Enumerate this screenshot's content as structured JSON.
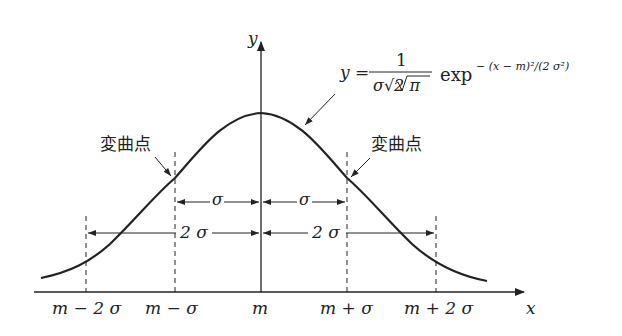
{
  "diagram": {
    "axes": {
      "x_label": "x",
      "y_label": "y"
    },
    "equation": {
      "lhs": "y =",
      "numerator": "1",
      "denominator": "σ√2 π",
      "exp": "exp",
      "exponent": "− (x − m)²/(2 σ²)"
    },
    "inflection_label_left": "変曲点",
    "inflection_label_right": "変曲点",
    "ticks": [
      "m − 2 σ",
      "m − σ",
      "m",
      "m + σ",
      "m + 2 σ"
    ],
    "spans": {
      "sigma_left": "σ",
      "sigma_right": "σ",
      "two_sigma_left": "2 σ",
      "two_sigma_right": "2 σ"
    }
  }
}
